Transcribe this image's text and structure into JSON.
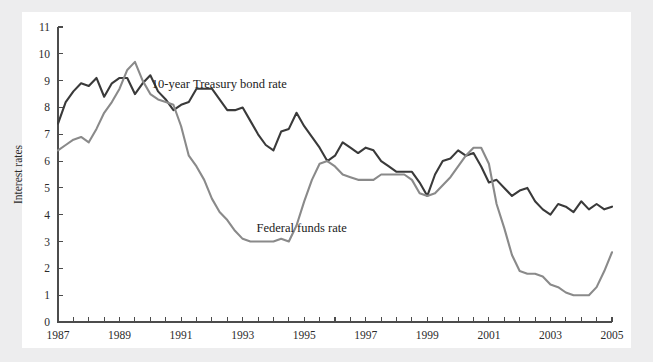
{
  "chart_data": {
    "type": "line",
    "title": "",
    "xlabel": "",
    "ylabel": "Interest rates",
    "xlim": [
      1987,
      2005
    ],
    "ylim": [
      0,
      11
    ],
    "grid": false,
    "legend_position": "inline-annotations",
    "y_ticks": [
      0,
      1,
      2,
      3,
      4,
      5,
      6,
      7,
      8,
      9,
      10,
      11
    ],
    "y_tick_labels": [
      "0",
      "1",
      "2",
      "3",
      "4",
      "5",
      "6",
      "7",
      "8",
      "9",
      "10",
      "11"
    ],
    "x_tick_labels": [
      "1987",
      "1989",
      "1991",
      "1993",
      "1995",
      "1997",
      "1999",
      "2001",
      "2003",
      "2005"
    ],
    "x_tick_values": [
      1987,
      1989,
      1991,
      1993,
      1995,
      1997,
      1999,
      2001,
      2003,
      2005
    ],
    "x_minor_tick_interval": 0.5,
    "annotations": [
      {
        "name": "treasury-label",
        "text": "10-year Treasury bond rate",
        "x": 1990.05,
        "y": 8.72
      },
      {
        "name": "fedfunds-label",
        "text": "Federal funds rate",
        "x": 1993.45,
        "y": 3.35
      }
    ],
    "x": [
      1987.0,
      1987.25,
      1987.5,
      1987.75,
      1988.0,
      1988.25,
      1988.5,
      1988.75,
      1989.0,
      1989.25,
      1989.5,
      1989.75,
      1990.0,
      1990.25,
      1990.5,
      1990.75,
      1991.0,
      1991.25,
      1991.5,
      1991.75,
      1992.0,
      1992.25,
      1992.5,
      1992.75,
      1993.0,
      1993.25,
      1993.5,
      1993.75,
      1994.0,
      1994.25,
      1994.5,
      1994.75,
      1995.0,
      1995.25,
      1995.5,
      1995.75,
      1996.0,
      1996.25,
      1996.5,
      1996.75,
      1997.0,
      1997.25,
      1997.5,
      1997.75,
      1998.0,
      1998.25,
      1998.5,
      1998.75,
      1999.0,
      1999.25,
      1999.5,
      1999.75,
      2000.0,
      2000.25,
      2000.5,
      2000.75,
      2001.0,
      2001.25,
      2001.5,
      2001.75,
      2002.0,
      2002.25,
      2002.5,
      2002.75,
      2003.0,
      2003.25,
      2003.5,
      2003.75,
      2004.0,
      2004.25,
      2004.5,
      2004.75,
      2005.0
    ],
    "series": [
      {
        "name": "10-year Treasury bond rate",
        "color": "#3a3a3a",
        "values": [
          7.4,
          8.2,
          8.6,
          8.9,
          8.8,
          9.1,
          8.4,
          8.9,
          9.1,
          9.1,
          8.5,
          8.9,
          9.2,
          8.6,
          8.3,
          7.9,
          8.1,
          8.2,
          8.7,
          8.7,
          8.7,
          8.3,
          7.9,
          7.9,
          8.0,
          7.5,
          7.0,
          6.6,
          6.4,
          7.1,
          7.2,
          7.8,
          7.3,
          6.9,
          6.5,
          6.0,
          6.2,
          6.7,
          6.5,
          6.3,
          6.5,
          6.4,
          6.0,
          5.8,
          5.6,
          5.6,
          5.6,
          5.2,
          4.7,
          5.5,
          6.0,
          6.1,
          6.4,
          6.2,
          6.3,
          5.8,
          5.2,
          5.3,
          5.0,
          4.7,
          4.9,
          5.0,
          4.5,
          4.2,
          4.0,
          4.4,
          4.3,
          4.1,
          4.5,
          4.2,
          4.4,
          4.2,
          4.3
        ]
      },
      {
        "name": "Federal funds rate",
        "color": "#8a8a8a",
        "values": [
          6.4,
          6.6,
          6.8,
          6.9,
          6.7,
          7.2,
          7.8,
          8.2,
          8.7,
          9.4,
          9.7,
          9.0,
          8.5,
          8.3,
          8.2,
          8.1,
          7.3,
          6.2,
          5.8,
          5.3,
          4.6,
          4.1,
          3.8,
          3.4,
          3.1,
          3.0,
          3.0,
          3.0,
          3.0,
          3.1,
          3.0,
          3.6,
          4.5,
          5.3,
          5.9,
          6.0,
          5.8,
          5.5,
          5.4,
          5.3,
          5.3,
          5.3,
          5.5,
          5.5,
          5.5,
          5.5,
          5.3,
          4.8,
          4.7,
          4.8,
          5.1,
          5.4,
          5.8,
          6.2,
          6.5,
          6.5,
          5.9,
          4.4,
          3.5,
          2.5,
          1.9,
          1.8,
          1.8,
          1.7,
          1.4,
          1.3,
          1.1,
          1.0,
          1.0,
          1.0,
          1.3,
          1.9,
          2.6
        ]
      }
    ]
  },
  "figure": {
    "background_color": "#ffffff",
    "page_background_color": "#ededee",
    "axis_color": "#4c4c4c"
  }
}
